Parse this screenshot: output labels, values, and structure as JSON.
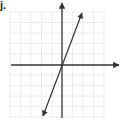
{
  "problem_label": "j.",
  "graph": {
    "grid_cells_x": 9,
    "grid_cells_y": 10,
    "axis_color": "#333333",
    "grid_color": "#bbbbbb",
    "line_color": "#333333",
    "line": {
      "description": "line through origin with positive slope",
      "passes_through": [
        0,
        0
      ],
      "slope": 2.5
    }
  }
}
